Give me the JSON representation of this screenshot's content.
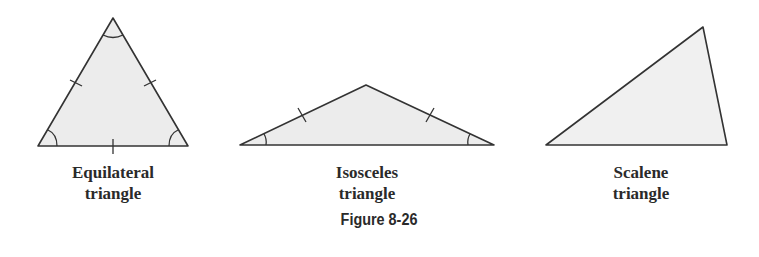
{
  "figure": {
    "caption": "Figure 8-26",
    "fill_color": "#ececec",
    "stroke_color": "#333333",
    "triangles": [
      {
        "name": "equilateral",
        "label_line1": "Equilateral",
        "label_line2": "triangle"
      },
      {
        "name": "isosceles",
        "label_line1": "Isosceles",
        "label_line2": "triangle"
      },
      {
        "name": "scalene",
        "label_line1": "Scalene",
        "label_line2": "triangle"
      }
    ]
  }
}
